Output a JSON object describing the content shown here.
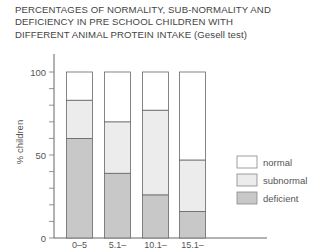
{
  "chart_data": {
    "type": "bar",
    "stacked": true,
    "title": "PERCENTAGES OF NORMALITY, SUB-NORMALITY AND DEFICIENCY IN PRE SCHOOL CHILDREN WITH DIFFERENT ANIMAL PROTEIN INTAKE",
    "title_suffix": "(Gesell test)",
    "title_lines": [
      "PERCENTAGES OF NORMALITY, SUB-NORMALITY AND",
      "DEFICIENCY IN PRE SCHOOL CHILDREN WITH",
      "DIFFERENT ANIMAL PROTEIN INTAKE"
    ],
    "xlabel": "",
    "ylabel": "% children",
    "ylim": [
      0,
      100
    ],
    "yticks": [
      0,
      50,
      100
    ],
    "minor_tick_step": 10,
    "grid": false,
    "legend_position": "right",
    "categories": [
      "0–5",
      "5.1–",
      "10.1–",
      "15.1–"
    ],
    "series": [
      {
        "name": "deficient",
        "color": "#c8c8c8",
        "values": [
          60,
          39,
          26,
          16
        ]
      },
      {
        "name": "subnormal",
        "color": "#ececec",
        "values": [
          23,
          31,
          51,
          31
        ]
      },
      {
        "name": "normal",
        "color": "#ffffff",
        "values": [
          17,
          30,
          23,
          53
        ]
      }
    ],
    "legend": [
      "normal",
      "subnormal",
      "deficient"
    ]
  }
}
